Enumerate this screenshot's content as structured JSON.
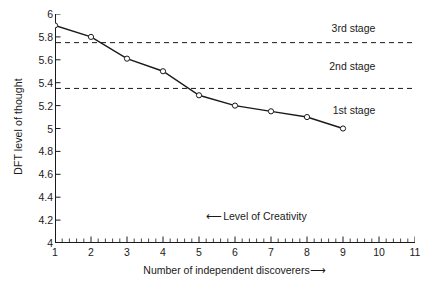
{
  "chart_data": {
    "type": "line",
    "title": "",
    "xlabel": "Number of independent discoverers",
    "xlabel_arrow": "⟶",
    "ylabel": "DFT level of thought",
    "x": [
      1,
      2,
      3,
      4,
      5,
      6,
      7,
      8,
      9
    ],
    "values": [
      5.9,
      5.8,
      5.61,
      5.5,
      5.29,
      5.2,
      5.15,
      5.1,
      5.0
    ],
    "series": [
      {
        "name": "DFT level of thought",
        "x": [
          1,
          2,
          3,
          4,
          5,
          6,
          7,
          8,
          9
        ],
        "values": [
          5.9,
          5.8,
          5.61,
          5.5,
          5.29,
          5.2,
          5.15,
          5.1,
          5.0
        ]
      }
    ],
    "xlim": [
      1,
      11
    ],
    "ylim": [
      4,
      6
    ],
    "xticks": [
      1,
      2,
      3,
      4,
      5,
      6,
      7,
      8,
      9,
      10,
      11
    ],
    "xtick_labels": [
      "1",
      "2",
      "3",
      "4",
      "5",
      "6",
      "7",
      "8",
      "9",
      "10",
      "11"
    ],
    "x_minor_tick_step": 0.2,
    "yticks": [
      6,
      5.8,
      5.6,
      5.4,
      5.2,
      5,
      4.8,
      4.6,
      4.4,
      4.2,
      4
    ],
    "ytick_labels": [
      "6",
      "5.8",
      "5.6",
      "5.4",
      "5.2",
      "5",
      "4.8",
      "4.6",
      "4.4",
      "4.2",
      "4"
    ],
    "grid": false,
    "legend": false,
    "marker": "open-circle",
    "line_color": "#1a1a1a",
    "marker_face_color": "#ffffff",
    "reference_lines": [
      {
        "name": "upper-threshold",
        "y": 5.75,
        "style": "dashed"
      },
      {
        "name": "lower-threshold",
        "y": 5.35,
        "style": "dashed"
      }
    ],
    "annotations": [
      {
        "name": "stage-3",
        "text": "3rd stage",
        "y": 5.88,
        "x": 9.9
      },
      {
        "name": "stage-2",
        "text": "2nd stage",
        "y": 5.55,
        "x": 9.9
      },
      {
        "name": "stage-1",
        "text": "1st stage",
        "y": 5.16,
        "x": 9.9
      },
      {
        "name": "level-of-creativity",
        "text": "Level of Creativity",
        "arrow": "⟵",
        "y": 4.23,
        "x": 5.2
      }
    ]
  }
}
